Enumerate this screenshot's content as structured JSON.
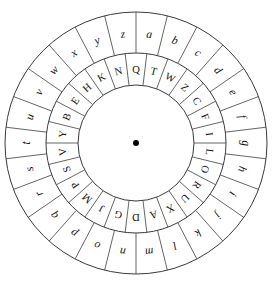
{
  "figure": {
    "background_color": "#ffffff",
    "line_color": "#3a3a3a",
    "text_color": "#111111",
    "center_dot_color": "#000000"
  },
  "geometry": {
    "center_x": 136,
    "center_y": 143,
    "outer_radius": 131,
    "middle_radius": 90,
    "inner_radius": 58,
    "center_dot_radius": 3,
    "segments": 26,
    "segment_degrees": 13.846,
    "outer_label_radius": 110,
    "inner_label_radius": 74
  },
  "outer_ring": {
    "name": "plaintext-ring",
    "case": "lowercase",
    "direction": "clockwise",
    "start_angle_deg": 6.923,
    "letters": [
      "a",
      "b",
      "c",
      "d",
      "e",
      "f",
      "g",
      "h",
      "i",
      "j",
      "k",
      "l",
      "m",
      "n",
      "o",
      "p",
      "q",
      "r",
      "s",
      "t",
      "u",
      "v",
      "w",
      "x",
      "y",
      "z"
    ]
  },
  "inner_ring": {
    "name": "ciphertext-ring",
    "case": "uppercase",
    "direction": "clockwise",
    "start_angle_deg": 0,
    "letters": [
      "Q",
      "T",
      "W",
      "Z",
      "C",
      "F",
      "I",
      "L",
      "O",
      "R",
      "U",
      "X",
      "A",
      "D",
      "G",
      "J",
      "M",
      "P",
      "S",
      "V",
      "Y",
      "B",
      "E",
      "H",
      "K",
      "N"
    ]
  },
  "center": {
    "name": "pivot-dot",
    "label": "•"
  }
}
